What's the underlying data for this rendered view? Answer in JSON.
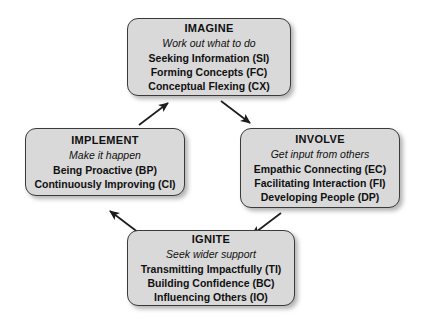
{
  "diagram": {
    "box_fill": "#d9d9d9",
    "box_border": "#3a3a3a",
    "background": "#ffffff",
    "nodes": [
      {
        "id": "imagine",
        "title": "IMAGINE",
        "subtitle": "Work out what to do",
        "items": [
          "Seeking Information (SI)",
          "Forming Concepts (FC)",
          "Conceptual Flexing (CX)"
        ]
      },
      {
        "id": "involve",
        "title": "INVOLVE",
        "subtitle": "Get input from others",
        "items": [
          "Empathic Connecting (EC)",
          "Facilitating Interaction (FI)",
          "Developing People (DP)"
        ]
      },
      {
        "id": "ignite",
        "title": "IGNITE",
        "subtitle": "Seek wider support",
        "items": [
          "Transmitting Impactfully (TI)",
          "Building Confidence (BC)",
          "Influencing Others (IO)"
        ]
      },
      {
        "id": "implement",
        "title": "IMPLEMENT",
        "subtitle": "Make it happen",
        "items": [
          "Being Proactive (BP)",
          "Continuously Improving (CI)"
        ]
      }
    ],
    "arrows": [
      {
        "id": "imagine-to-involve",
        "from": "imagine",
        "to": "involve",
        "direction": "down-right"
      },
      {
        "id": "involve-to-ignite",
        "from": "involve",
        "to": "ignite",
        "direction": "down-left"
      },
      {
        "id": "ignite-to-implement",
        "from": "ignite",
        "to": "implement",
        "direction": "up-left"
      },
      {
        "id": "implement-to-imagine",
        "from": "implement",
        "to": "imagine",
        "direction": "up-right"
      }
    ]
  }
}
